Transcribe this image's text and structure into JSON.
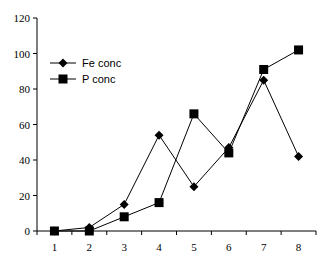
{
  "chart_data": {
    "type": "line",
    "title": "",
    "xlabel": "",
    "ylabel": "",
    "categories": [
      "1",
      "2",
      "3",
      "4",
      "5",
      "6",
      "7",
      "8"
    ],
    "ylim": [
      0,
      120
    ],
    "yticks": [
      0,
      20,
      40,
      60,
      80,
      100,
      120
    ],
    "grid": false,
    "legend_position": "top-left",
    "series": [
      {
        "name": "Fe conc",
        "marker": "diamond",
        "color": "#000000",
        "values": [
          0,
          2,
          15,
          54,
          25,
          47,
          85,
          42
        ]
      },
      {
        "name": "P conc",
        "marker": "square",
        "color": "#000000",
        "values": [
          0,
          0,
          8,
          16,
          66,
          44,
          91,
          102
        ]
      }
    ]
  }
}
